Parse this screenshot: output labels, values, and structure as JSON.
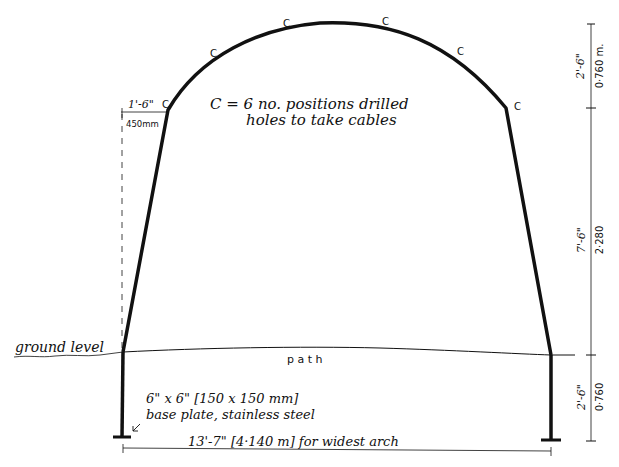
{
  "drawing": {
    "arch_labels": [
      "C",
      "C",
      "C",
      "C",
      "C",
      "C"
    ],
    "legend_line1": "C = 6 no. positions drilled",
    "legend_line2": "holes to take cables",
    "shoulder_dim_imperial": "1'-6\"",
    "shoulder_dim_metric": "450mm",
    "ground_label": "ground level",
    "path_label": "p a t h",
    "base_plate_line1": "6\" x 6\" [150 x 150 mm]",
    "base_plate_line2": "base plate, stainless steel",
    "width_dim": "13'-7\" [4·140 m] for widest arch",
    "right_dims": {
      "top_imperial": "2'-6\"",
      "top_metric": "0·760 m.",
      "mid_imperial": "7'-6\"",
      "mid_metric": "2·280",
      "bottom_imperial": "2'-6\"",
      "bottom_metric": "0·760"
    }
  },
  "colors": {
    "ink": "#111111",
    "paper": "#ffffff"
  }
}
